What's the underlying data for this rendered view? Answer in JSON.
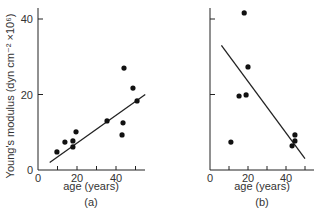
{
  "chart_data": [
    {
      "type": "scatter",
      "panel_label": "(a)",
      "title": "",
      "xlabel": "age (years)",
      "ylabel": "Young's modulus (dyn cm⁻² ×10⁶)",
      "xlim": [
        0,
        55
      ],
      "ylim": [
        0,
        42
      ],
      "x_ticks": [
        0,
        20,
        40
      ],
      "y_ticks": [
        0,
        20,
        40
      ],
      "grid": false,
      "points": [
        {
          "x": 9.7,
          "y": 4.8
        },
        {
          "x": 13.8,
          "y": 7.4
        },
        {
          "x": 17.9,
          "y": 7.7
        },
        {
          "x": 17.9,
          "y": 6.1
        },
        {
          "x": 19.5,
          "y": 10.1
        },
        {
          "x": 35.4,
          "y": 13.0
        },
        {
          "x": 43.1,
          "y": 9.3
        },
        {
          "x": 43.6,
          "y": 12.5
        },
        {
          "x": 44.1,
          "y": 27.0
        },
        {
          "x": 48.7,
          "y": 21.7
        },
        {
          "x": 50.8,
          "y": 18.3
        }
      ],
      "fit_line": {
        "x1": 6,
        "y1": 2,
        "x2": 55,
        "y2": 20
      }
    },
    {
      "type": "scatter",
      "panel_label": "(b)",
      "title": "",
      "xlabel": "age (years)",
      "ylabel": "",
      "xlim": [
        0,
        55
      ],
      "ylim": [
        0,
        42
      ],
      "x_ticks": [
        0,
        20,
        40
      ],
      "y_ticks": [],
      "grid": false,
      "points": [
        {
          "x": 18.0,
          "y": 41.6
        },
        {
          "x": 20.0,
          "y": 27.3
        },
        {
          "x": 15.3,
          "y": 19.6
        },
        {
          "x": 19.0,
          "y": 19.9
        },
        {
          "x": 11.0,
          "y": 7.4
        },
        {
          "x": 44.7,
          "y": 9.3
        },
        {
          "x": 44.7,
          "y": 7.7
        },
        {
          "x": 43.2,
          "y": 6.4
        }
      ],
      "fit_line": {
        "x1": 6,
        "y1": 33,
        "x2": 50,
        "y2": 3
      }
    }
  ]
}
